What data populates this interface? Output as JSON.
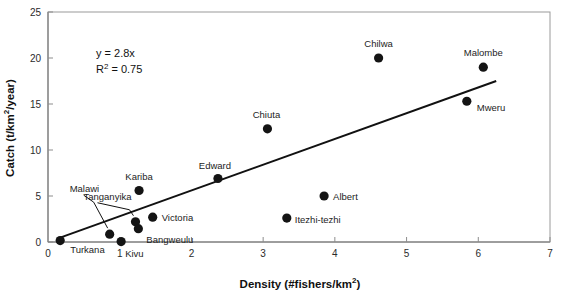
{
  "chart_data": {
    "type": "scatter",
    "title": "",
    "xlabel": "Density (#fishers/km2)",
    "xlabel_main": "Density (#fishers/km",
    "xlabel_sup": "2",
    "xlabel_tail": ")",
    "ylabel": "Catch (t/km2/year)",
    "ylabel_main": "Catch (t/km",
    "ylabel_sup": "2",
    "ylabel_tail": "/year)",
    "xlim": [
      0,
      7
    ],
    "ylim": [
      0,
      25
    ],
    "xticks": [
      0,
      1,
      2,
      3,
      4,
      5,
      6,
      7
    ],
    "xtick_labels": [
      "0",
      "1",
      "2",
      "3",
      "4",
      "5",
      "6",
      "7"
    ],
    "yticks": [
      0,
      5,
      10,
      15,
      20,
      25
    ],
    "ytick_labels": [
      "0",
      "5",
      "10",
      "15",
      "20",
      "25"
    ],
    "grid": false,
    "legend": "none",
    "annotations": [
      {
        "name": "equation",
        "text": "y = 2.8x"
      },
      {
        "name": "r-squared",
        "text_main": "R",
        "text_sup": "2",
        "text_tail": " = 0.75"
      }
    ],
    "trendline": {
      "equation": "y = 2.8x",
      "slope": 2.8,
      "intercept": 0,
      "r_squared": 0.75,
      "x_start": 0.15,
      "x_end": 6.25
    },
    "points": [
      {
        "label": "Turkana",
        "x": 0.17,
        "y": 0.15,
        "label_dx": 10,
        "label_dy": 12,
        "anchor": "start",
        "leader": false
      },
      {
        "label": "Malawi",
        "x": 0.86,
        "y": 0.85,
        "label_dx": -40,
        "label_dy": -42,
        "anchor": "start",
        "leader": true,
        "leader_x2": -16,
        "leader_y2": -32
      },
      {
        "label": "Kivu",
        "x": 1.02,
        "y": 0.05,
        "label_dx": 4,
        "label_dy": 15,
        "anchor": "start",
        "leader": false
      },
      {
        "label": "Tanganyika",
        "x": 1.22,
        "y": 2.2,
        "label_dx": -52,
        "label_dy": -22,
        "anchor": "start",
        "leader": true,
        "leader_x2": -6,
        "leader_y2": -12
      },
      {
        "label": "Bangweulu",
        "x": 1.26,
        "y": 1.45,
        "label_dx": 8,
        "label_dy": 14,
        "anchor": "start",
        "leader": false
      },
      {
        "label": "Kariba",
        "x": 1.27,
        "y": 5.6,
        "label_dx": 0,
        "label_dy": -10,
        "anchor": "middle",
        "leader": false
      },
      {
        "label": "Victoria",
        "x": 1.46,
        "y": 2.7,
        "label_dx": 9,
        "label_dy": 4,
        "anchor": "start",
        "leader": false
      },
      {
        "label": "Edward",
        "x": 2.37,
        "y": 6.9,
        "label_dx": -3,
        "label_dy": -10,
        "anchor": "middle",
        "leader": false
      },
      {
        "label": "Chiuta",
        "x": 3.06,
        "y": 12.3,
        "label_dx": -1,
        "label_dy": -11,
        "anchor": "middle",
        "leader": false
      },
      {
        "label": "Itezhi-tezhi",
        "x": 3.33,
        "y": 2.6,
        "label_dx": 8,
        "label_dy": 5,
        "anchor": "start",
        "leader": false
      },
      {
        "label": "Albert",
        "x": 3.85,
        "y": 5.0,
        "label_dx": 9,
        "label_dy": 4,
        "anchor": "start",
        "leader": false
      },
      {
        "label": "Chilwa",
        "x": 4.61,
        "y": 20.0,
        "label_dx": 0,
        "label_dy": -11,
        "anchor": "middle",
        "leader": false
      },
      {
        "label": "Mweru",
        "x": 5.84,
        "y": 15.3,
        "label_dx": 10,
        "label_dy": 10,
        "anchor": "start",
        "leader": false
      },
      {
        "label": "Malombe",
        "x": 6.07,
        "y": 19.0,
        "label_dx": 0,
        "label_dy": -11,
        "anchor": "middle",
        "leader": false
      }
    ],
    "colors": {
      "marker": "#141414",
      "trendline": "#111111",
      "frame": "#9a9a9a",
      "text": "#1d1d1d",
      "background": "#ffffff"
    }
  }
}
